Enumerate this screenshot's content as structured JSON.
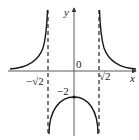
{
  "diagram": {
    "type": "function-graph",
    "axes": {
      "x_label": "x",
      "y_label": "y",
      "origin_label": "0"
    },
    "asymptotes": [
      {
        "label": "−√2",
        "x": -1.414
      },
      {
        "label": "√2",
        "x": 1.414
      }
    ],
    "points": [
      {
        "label": "−2",
        "x": 0,
        "y": -2
      }
    ],
    "colors": {
      "curve": "#1a1a1a",
      "axis": "#333333",
      "background": "#ffffff"
    }
  }
}
